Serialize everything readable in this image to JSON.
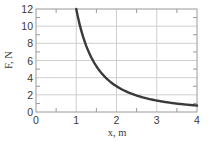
{
  "chart_data": {
    "type": "line",
    "title": "",
    "xlabel": "x, m",
    "ylabel": "F, N",
    "xlim": [
      0,
      4
    ],
    "ylim": [
      0,
      12
    ],
    "xticks": [
      0,
      1,
      2,
      3,
      4
    ],
    "yticks": [
      0,
      2,
      4,
      6,
      8,
      10,
      12
    ],
    "grid": true,
    "legend": null,
    "series": [
      {
        "name": "F(x)",
        "equation": "F = 12/x^2",
        "x": [
          1.0,
          1.25,
          1.5,
          1.75,
          2.0,
          2.5,
          3.0,
          3.5,
          4.0
        ],
        "y": [
          12.0,
          7.68,
          5.33,
          3.92,
          3.0,
          1.92,
          1.33,
          0.98,
          0.75
        ]
      }
    ]
  },
  "colors": {
    "curve": "#3a3a3a",
    "grid": "#cfcfcf",
    "frame": "#9a9a9a",
    "text": "#3a3a3a"
  }
}
